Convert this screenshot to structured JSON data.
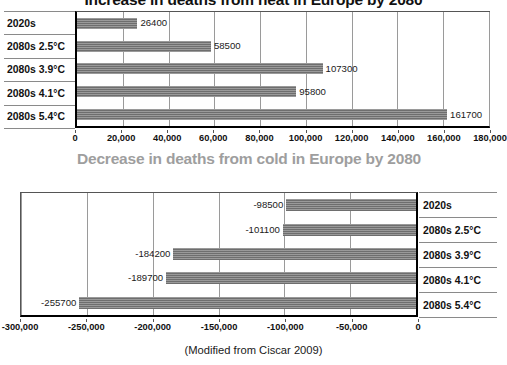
{
  "source_note": "(Modified from Ciscar 2009)",
  "bar_color": "#6e6e6e",
  "chart_data": [
    {
      "type": "bar",
      "orientation": "horizontal",
      "title": "Increase in deaths from heat in Europe by 2080",
      "title_color": "#111111",
      "categories": [
        "2020s",
        "2080s 2.5°C",
        "2080s 3.9°C",
        "2080s 4.1°C",
        "2080s 5.4°C"
      ],
      "values": [
        26400,
        58500,
        107300,
        95800,
        161700
      ],
      "data_labels": [
        "26400",
        "58500",
        "107300",
        "95800",
        "161700"
      ],
      "xlabel": "",
      "ylabel": "",
      "xlim": [
        0,
        180000
      ],
      "xticks": [
        0,
        20000,
        40000,
        60000,
        80000,
        100000,
        120000,
        140000,
        160000,
        180000
      ],
      "xtick_labels": [
        "0",
        "20,000",
        "40,000",
        "60,000",
        "80,000",
        "100,000",
        "120,000",
        "140,000",
        "160,000",
        "180,000"
      ],
      "grid": true,
      "category_label_side": "left",
      "legend": "none"
    },
    {
      "type": "bar",
      "orientation": "horizontal",
      "title": "Decrease in deaths from cold in Europe by 2080",
      "title_color": "#9e9e9e",
      "categories": [
        "2020s",
        "2080s 2.5°C",
        "2080s 3.9°C",
        "2080s 4.1°C",
        "2080s 5.4°C"
      ],
      "values": [
        -98500,
        -101100,
        -184200,
        -189700,
        -255700
      ],
      "data_labels": [
        "-98500",
        "-101100",
        "-184200",
        "-189700",
        "-255700"
      ],
      "xlabel": "",
      "ylabel": "",
      "xlim": [
        -300000,
        0
      ],
      "xticks": [
        -300000,
        -250000,
        -200000,
        -150000,
        -100000,
        -50000,
        0
      ],
      "xtick_labels": [
        "-300,000",
        "-250,000",
        "-200,000",
        "-150,000",
        "-100,000",
        "-50,000",
        "0"
      ],
      "grid": true,
      "category_label_side": "right",
      "legend": "none"
    }
  ]
}
